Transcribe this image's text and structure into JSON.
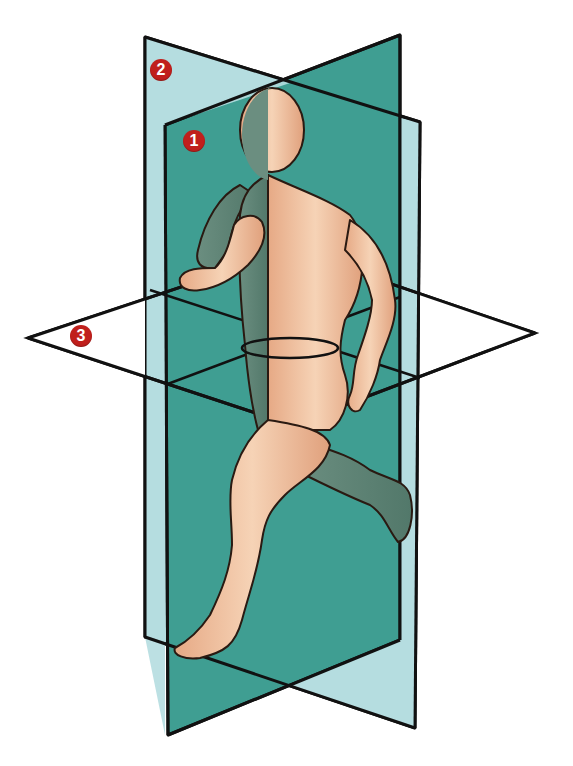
{
  "figure": {
    "colors": {
      "plane_light": "#b5dde0",
      "plane_teal": "#3f9e92",
      "plane_outline": "#111111",
      "skin": "#f2c7a4",
      "skin_shade": "#d99a78",
      "body_shadow": "#5f8a7c",
      "marker": "#c01f1c"
    },
    "planes": [
      {
        "id": 1,
        "label": "1",
        "name": "sagittal-plane",
        "fill": "teal"
      },
      {
        "id": 2,
        "label": "2",
        "name": "frontal-plane",
        "fill": "light"
      },
      {
        "id": 3,
        "label": "3",
        "name": "transverse-plane",
        "fill": "none"
      }
    ]
  }
}
